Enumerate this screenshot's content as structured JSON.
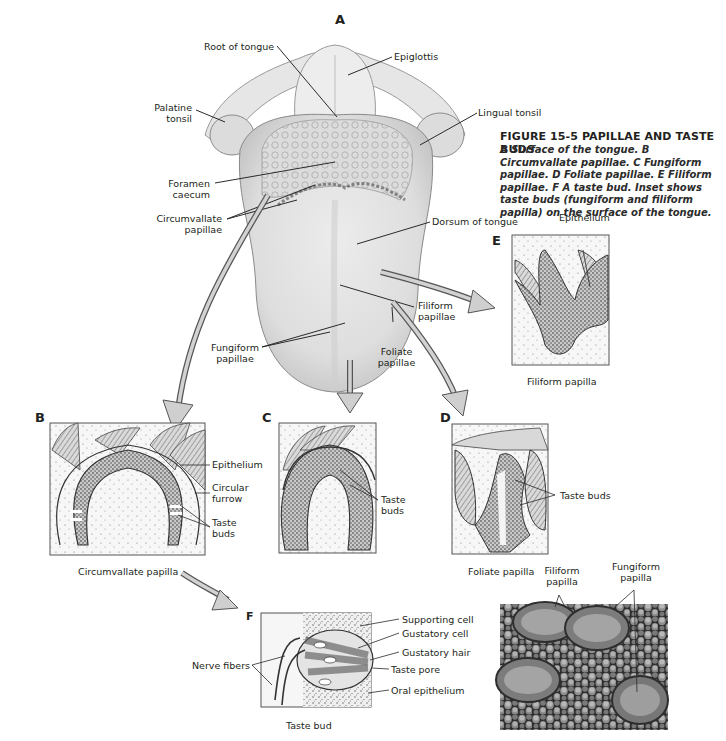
{
  "figure": {
    "title": "FIGURE 15-5 PAPILLAE AND TASTE BUDS",
    "caption_segments": [
      {
        "letter": "A",
        "text": " Surface of the tongue. "
      },
      {
        "letter": "B",
        "text": " Circumvallate papillae. "
      },
      {
        "letter": "C",
        "text": " Fungiform papillae. "
      },
      {
        "letter": "D",
        "text": " Foliate papillae. "
      },
      {
        "letter": "E",
        "text": " Filiform papillae. "
      },
      {
        "letter": "F",
        "text": " A taste bud. Inset shows taste buds (fungiform and filiform papilla) on the surface of the tongue."
      }
    ]
  },
  "panels": {
    "A": {
      "letter": "A",
      "labels": {
        "root_of_tongue": "Root of tongue",
        "epiglottis": "Epiglottis",
        "palatine_tonsil_1": "Palatine",
        "palatine_tonsil_2": "tonsil",
        "lingual_tonsil": "Lingual tonsil",
        "foramen_caecum_1": "Foramen",
        "foramen_caecum_2": "caecum",
        "circumvallate_1": "Circumvallate",
        "circumvallate_2": "papillae",
        "dorsum": "Dorsum of tongue",
        "filiform_1": "Filiform",
        "filiform_2": "papillae",
        "fungiform_1": "Fungiform",
        "fungiform_2": "papillae",
        "foliate_1": "Foliate",
        "foliate_2": "papillae"
      }
    },
    "B": {
      "letter": "B",
      "caption": "Circumvallate papilla",
      "labels": {
        "epithelium": "Epithelium",
        "circular_furrow_1": "Circular",
        "circular_furrow_2": "furrow",
        "taste_buds_1": "Taste",
        "taste_buds_2": "buds"
      }
    },
    "C": {
      "letter": "C",
      "labels": {
        "taste_buds_1": "Taste",
        "taste_buds_2": "buds"
      }
    },
    "D": {
      "letter": "D",
      "caption": "Foliate papilla",
      "labels": {
        "taste_buds": "Taste buds"
      }
    },
    "E": {
      "letter": "E",
      "caption": "Filiform papilla",
      "labels": {
        "epithelium": "Epithelium"
      }
    },
    "F": {
      "letter": "F",
      "caption": "Taste bud",
      "labels": {
        "supporting_cell": "Supporting cell",
        "gustatory_cell": "Gustatory cell",
        "gustatory_hair": "Gustatory hair",
        "taste_pore": "Taste pore",
        "oral_epithelium": "Oral epithelium",
        "nerve_fibers": "Nerve fibers"
      }
    },
    "inset": {
      "labels": {
        "filiform_1": "Filiform",
        "filiform_2": "papilla",
        "fungiform_1": "Fungiform",
        "fungiform_2": "papilla"
      }
    }
  },
  "colors": {
    "text": "#231f20",
    "leader_line": "#2a2a2a",
    "tongue_fill": "#e3e3e3",
    "tongue_shade": "#c9c9c9",
    "arrow_fill": "#c8c8c8",
    "arrow_stroke": "#555555",
    "stipple": "#6a6a6a",
    "sem_dark": "#2e2e2e",
    "sem_light": "#9a9a9a"
  }
}
